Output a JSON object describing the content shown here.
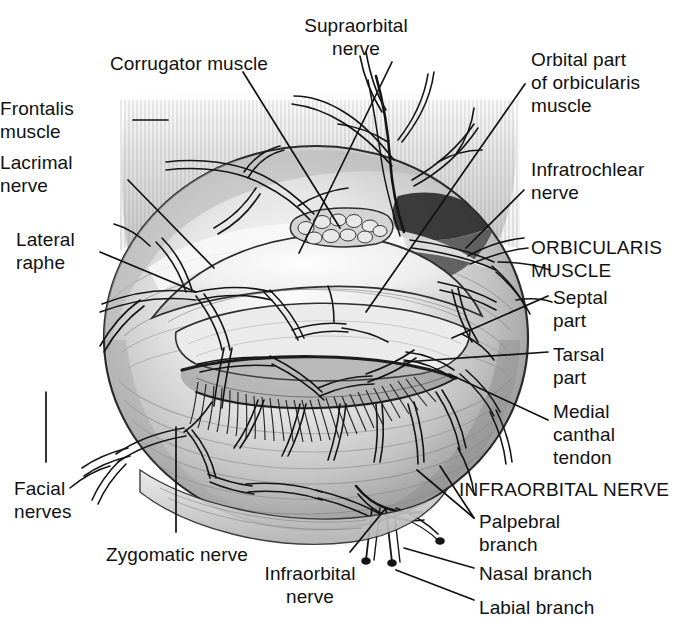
{
  "figure": {
    "kind": "anatomical-line-drawing",
    "background_color": "#ffffff",
    "ink_color": "#111111",
    "shading_colors": [
      "#f2f2f2",
      "#d9d9d9",
      "#bdbdbd",
      "#9a9a9a",
      "#6e6e6e",
      "#3a3a3a"
    ],
    "width": 693,
    "height": 643
  },
  "labels": [
    {
      "id": "supraorbital-nerve",
      "text": "Supraorbital\nnerve",
      "x": 356,
      "y": 14,
      "align": "center",
      "caps": false
    },
    {
      "id": "corrugator-muscle",
      "text": "Corrugator muscle",
      "x": 110,
      "y": 52,
      "align": "left",
      "caps": false
    },
    {
      "id": "orbital-part",
      "text": "Orbital part\nof orbicularis\nmuscle",
      "x": 531,
      "y": 48,
      "align": "left",
      "caps": false
    },
    {
      "id": "frontalis-muscle",
      "text": "Frontalis\nmuscle",
      "x": 33,
      "y": 97,
      "align": "right",
      "caps": false
    },
    {
      "id": "lacrimal-nerve",
      "text": "Lacrimal\nnerve",
      "x": 33,
      "y": 151,
      "align": "right",
      "caps": false
    },
    {
      "id": "infratrochlear-nerve",
      "text": "Infratrochlear\nnerve",
      "x": 531,
      "y": 158,
      "align": "left",
      "caps": false
    },
    {
      "id": "lateral-raphe",
      "text": "Lateral\nraphe",
      "x": 16,
      "y": 228,
      "align": "left",
      "caps": false
    },
    {
      "id": "orbicularis-muscle",
      "text": "ORBICULARIS\nMUSCLE",
      "x": 531,
      "y": 236,
      "align": "left",
      "caps": true
    },
    {
      "id": "septal-part",
      "text": "Septal\npart",
      "x": 553,
      "y": 286,
      "align": "left",
      "caps": false
    },
    {
      "id": "tarsal-part",
      "text": "Tarsal\npart",
      "x": 553,
      "y": 343,
      "align": "left",
      "caps": false
    },
    {
      "id": "medial-canthal-tendon",
      "text": "Medial\ncanthal\ntendon",
      "x": 553,
      "y": 400,
      "align": "left",
      "caps": false
    },
    {
      "id": "facial-nerves",
      "text": "Facial\nnerves",
      "x": 14,
      "y": 477,
      "align": "left",
      "caps": false
    },
    {
      "id": "infraorbital-nerve-caps",
      "text": "INFRAORBITAL NERVE",
      "x": 459,
      "y": 478,
      "align": "left",
      "caps": true
    },
    {
      "id": "palpebral-branch",
      "text": "Palpebral\nbranch",
      "x": 479,
      "y": 510,
      "align": "left",
      "caps": false
    },
    {
      "id": "zygomatic-nerve",
      "text": "Zygomatic nerve",
      "x": 106,
      "y": 543,
      "align": "left",
      "caps": false
    },
    {
      "id": "nasal-branch",
      "text": "Nasal branch",
      "x": 479,
      "y": 562,
      "align": "left",
      "caps": false
    },
    {
      "id": "infraorbital-nerve",
      "text": "Infraorbital\nnerve",
      "x": 310,
      "y": 562,
      "align": "center",
      "caps": false
    },
    {
      "id": "labial-branch",
      "text": "Labial branch",
      "x": 479,
      "y": 596,
      "align": "left",
      "caps": false
    }
  ],
  "leader_lines": [
    {
      "id": "leader-supraorbital",
      "from": [
        392,
        62
      ],
      "to": [
        299,
        253
      ]
    },
    {
      "id": "leader-corrugator",
      "from": [
        243,
        72
      ],
      "to": [
        340,
        228
      ]
    },
    {
      "id": "leader-frontalis",
      "from": [
        133,
        120
      ],
      "to": [
        168,
        120
      ]
    },
    {
      "id": "leader-orbital-part",
      "from": [
        525,
        84
      ],
      "to": [
        366,
        312
      ]
    },
    {
      "id": "leader-lacrimal",
      "from": [
        128,
        180
      ],
      "to": [
        214,
        268
      ]
    },
    {
      "id": "leader-infratrochlear",
      "from": [
        524,
        190
      ],
      "to": [
        466,
        248
      ]
    },
    {
      "id": "leader-lateral-raphe",
      "from": [
        100,
        252
      ],
      "to": [
        196,
        292
      ]
    },
    {
      "id": "leader-septal",
      "from": [
        548,
        296
      ],
      "to": [
        452,
        338
      ]
    },
    {
      "id": "leader-tarsal",
      "from": [
        548,
        352
      ],
      "to": [
        404,
        362
      ]
    },
    {
      "id": "leader-medial-canthal",
      "from": [
        548,
        420
      ],
      "to": [
        449,
        374
      ]
    },
    {
      "id": "leader-facial-nerves",
      "from": [
        46,
        462
      ],
      "to": [
        46,
        392
      ]
    },
    {
      "id": "leader-palpebral",
      "from": [
        474,
        518
      ],
      "to": [
        417,
        470
      ]
    },
    {
      "id": "leader-palpebral-2",
      "from": [
        474,
        518
      ],
      "to": [
        440,
        466
      ]
    },
    {
      "id": "leader-zygomatic",
      "from": [
        176,
        532
      ],
      "to": [
        176,
        427
      ]
    },
    {
      "id": "leader-nasal",
      "from": [
        474,
        568
      ],
      "to": [
        404,
        548
      ]
    },
    {
      "id": "leader-infraorbital",
      "from": [
        350,
        552
      ],
      "to": [
        386,
        508
      ]
    },
    {
      "id": "leader-labial",
      "from": [
        474,
        600
      ],
      "to": [
        396,
        570
      ]
    }
  ],
  "structures": [
    {
      "id": "orbicularis-mass",
      "name": "orbicularis oculi muscle mass",
      "shape": "large oval"
    },
    {
      "id": "frontalis-hatching",
      "name": "frontalis muscle vertical striation",
      "shape": "vertical hatch field"
    },
    {
      "id": "palpebral-fissure",
      "name": "eyelid aperture with lashes",
      "shape": "lens"
    },
    {
      "id": "lacrimal-gland",
      "name": "lacrimal gland lobules",
      "shape": "grape cluster"
    },
    {
      "id": "nerve-web",
      "name": "branching nerve network",
      "shape": "dendritic lines"
    }
  ]
}
